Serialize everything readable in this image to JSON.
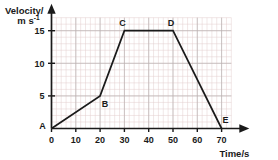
{
  "chart_data": {
    "type": "line",
    "title": "",
    "xlabel": "Time/s",
    "ylabel_line1": "Velocity/",
    "ylabel_line2": "m s",
    "ylabel_exponent": "-1",
    "xlim": [
      0,
      74
    ],
    "ylim": [
      0,
      17
    ],
    "xticks": [
      0,
      10,
      20,
      30,
      40,
      50,
      60,
      70
    ],
    "xtick_labels": [
      "0",
      "10",
      "20",
      "30",
      "40",
      "50",
      "60",
      "70"
    ],
    "yticks": [
      5,
      10,
      15
    ],
    "ytick_labels": [
      "5",
      "10",
      "15"
    ],
    "grid": true,
    "grid_minor_step_x": 2,
    "grid_minor_step_y": 1,
    "legend": "none",
    "x": [
      0,
      20,
      30,
      50,
      70
    ],
    "values": [
      0,
      5,
      15,
      15,
      0
    ],
    "series": [
      {
        "name": "velocity",
        "points": [
          {
            "label": "A",
            "x": 0,
            "y": 0,
            "label_dx": -9,
            "label_dy": 0
          },
          {
            "label": "B",
            "x": 20,
            "y": 5,
            "label_dx": 5,
            "label_dy": 11
          },
          {
            "label": "C",
            "x": 30,
            "y": 15,
            "label_dx": -2,
            "label_dy": -5
          },
          {
            "label": "D",
            "x": 50,
            "y": 15,
            "label_dx": -2,
            "label_dy": -5
          },
          {
            "label": "E",
            "x": 70,
            "y": 0,
            "label_dx": 4,
            "label_dy": -6
          }
        ]
      }
    ],
    "annotations": [
      "A",
      "B",
      "C",
      "D",
      "E"
    ],
    "colors": {
      "curve": "#1a1a1a",
      "axis": "#1a1a1a",
      "grid_minor": "#e3cfcf",
      "grid_major": "#b9b2b2",
      "background": "#ffffff"
    }
  }
}
